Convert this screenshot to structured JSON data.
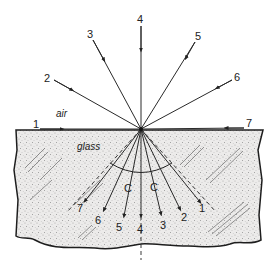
{
  "diagram": {
    "media": {
      "upper": "air",
      "lower": "glass"
    },
    "vertex": {
      "x": 141,
      "y": 129
    },
    "incident_rays": [
      {
        "label": "1",
        "start": [
          22,
          129
        ],
        "label_pos": [
          33,
          128
        ]
      },
      {
        "label": "2",
        "start": [
          54,
          80
        ],
        "label_pos": [
          44,
          81
        ]
      },
      {
        "label": "3",
        "start": [
          93,
          40
        ],
        "label_pos": [
          87,
          37
        ]
      },
      {
        "label": "4",
        "start": [
          141,
          26
        ],
        "label_pos": [
          137,
          22
        ]
      },
      {
        "label": "5",
        "start": [
          195,
          42
        ],
        "label_pos": [
          195,
          39
        ]
      },
      {
        "label": "6",
        "start": [
          232,
          80
        ],
        "label_pos": [
          234,
          80
        ]
      },
      {
        "label": "7",
        "start": [
          244,
          128
        ],
        "label_pos": [
          246,
          127
        ]
      }
    ],
    "refracted_rays": [
      {
        "label": "7",
        "end": [
          85,
          201
        ],
        "label_pos": [
          77,
          211
        ]
      },
      {
        "label": "6",
        "end": [
          104,
          210
        ],
        "label_pos": [
          95,
          224
        ]
      },
      {
        "label": "5",
        "end": [
          124,
          216
        ],
        "label_pos": [
          116,
          231
        ]
      },
      {
        "label": "4",
        "end": [
          141,
          216
        ],
        "label_pos": [
          137,
          233
        ]
      },
      {
        "label": "3",
        "end": [
          161,
          214
        ],
        "label_pos": [
          160,
          229
        ]
      },
      {
        "label": "2",
        "end": [
          180,
          209
        ],
        "label_pos": [
          181,
          221
        ]
      },
      {
        "label": "1",
        "end": [
          200,
          202
        ],
        "label_pos": [
          199,
          211
        ]
      }
    ],
    "critical_angle_marks": [
      {
        "label": "C",
        "pos": [
          124,
          192
        ]
      },
      {
        "label": "C",
        "pos": [
          150,
          191
        ]
      }
    ],
    "normal_line": {
      "x": 141,
      "y_end": 260
    }
  }
}
